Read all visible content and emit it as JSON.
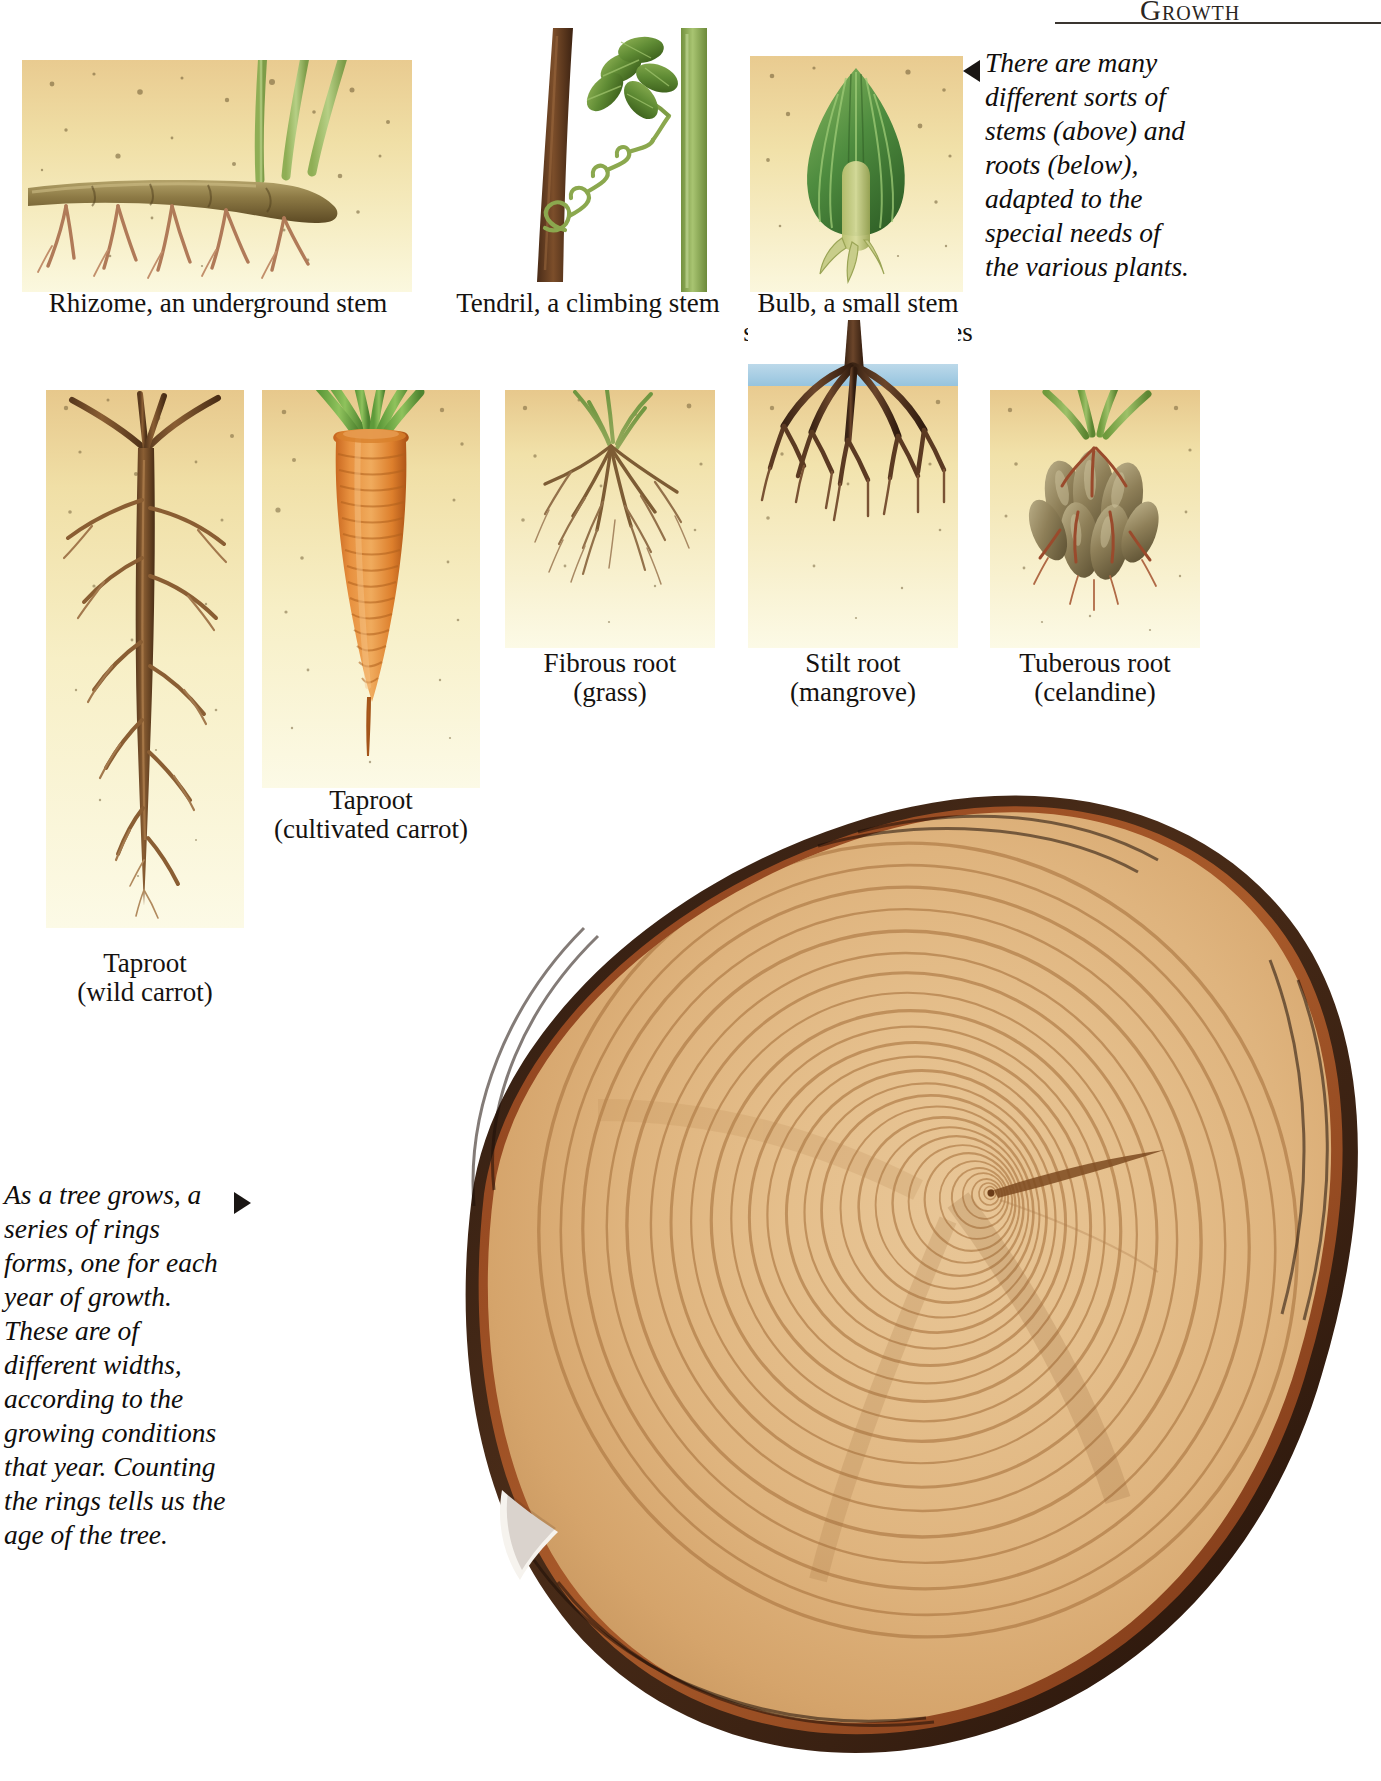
{
  "page": {
    "header_title": "Growth",
    "background": "#ffffff"
  },
  "stems": {
    "items": [
      {
        "id": "rhizome",
        "caption": "Rhizome, an underground stem"
      },
      {
        "id": "tendril",
        "caption": "Tendril, a climbing stem"
      },
      {
        "id": "bulb",
        "caption_line1": "Bulb, a small stem",
        "caption_line2": "surrounded by leaves"
      }
    ]
  },
  "roots": {
    "items": [
      {
        "id": "taproot-wild",
        "caption_line1": "Taproot",
        "caption_line2": "(wild carrot)"
      },
      {
        "id": "taproot-culti",
        "caption_line1": "Taproot",
        "caption_line2": "(cultivated carrot)"
      },
      {
        "id": "fibrous",
        "caption_line1": "Fibrous root",
        "caption_line2": "(grass)"
      },
      {
        "id": "stilt",
        "caption_line1": "Stilt root",
        "caption_line2": "(mangrove)"
      },
      {
        "id": "tuberous",
        "caption_line1": "Tuberous root",
        "caption_line2": "(celandine)"
      }
    ]
  },
  "notes": {
    "stems_roots": "There are many different sorts of stems (above) and roots (below), adapted to the special needs of the various plants.",
    "tree_rings": "As a tree grows, a series of rings forms, one for each year of growth. These are of different widths, according to the growing conditions that year. Counting the rings tells us the age of the tree."
  },
  "colors": {
    "soil_top": "#e8c88c",
    "soil_bottom": "#faf6dc",
    "water_sky": "#a9cfe4",
    "root_brown": "#7a4a2a",
    "carrot_orange": "#e3862f",
    "leaf_green": "#7aa23e",
    "bark_dark": "#3a241a",
    "wood_light": "#e3bb84"
  }
}
